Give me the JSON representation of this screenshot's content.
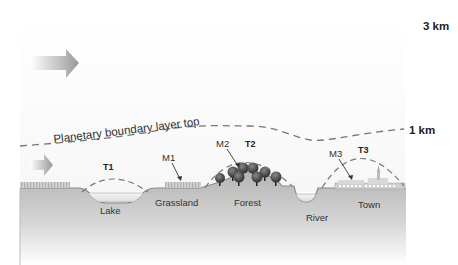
{
  "diagram": {
    "heights": {
      "top": "3 km",
      "pbl": "1 km"
    },
    "pbl_label": "Planetary boundary layer top",
    "surfaces": [
      {
        "id": "lake",
        "label": "Lake",
        "thermal": "T1",
        "measurement": ""
      },
      {
        "id": "grassland",
        "label": "Grassland",
        "thermal": "",
        "measurement": "M1"
      },
      {
        "id": "forest",
        "label": "Forest",
        "thermal": "T2",
        "measurement": "M2"
      },
      {
        "id": "river",
        "label": "River",
        "thermal": "",
        "measurement": ""
      },
      {
        "id": "town",
        "label": "Town",
        "thermal": "T3",
        "measurement": "M3"
      }
    ],
    "labels": {
      "t1": "T1",
      "t2": "T2",
      "t3": "T3",
      "m1": "M1",
      "m2": "M2",
      "m3": "M3",
      "lake": "Lake",
      "grassland": "Grassland",
      "forest": "Forest",
      "river": "River",
      "town": "Town"
    },
    "arrows": [
      {
        "name": "upper-wind-arrow",
        "meaning": "wind direction aloft"
      },
      {
        "name": "surface-wind-arrow",
        "meaning": "wind direction near surface"
      }
    ],
    "colors": {
      "ground_top": "#b8b8b8",
      "ground_bottom": "#ffffff",
      "dash_line": "#777777",
      "tree": "#3a3a3a",
      "text": "#333333"
    }
  }
}
